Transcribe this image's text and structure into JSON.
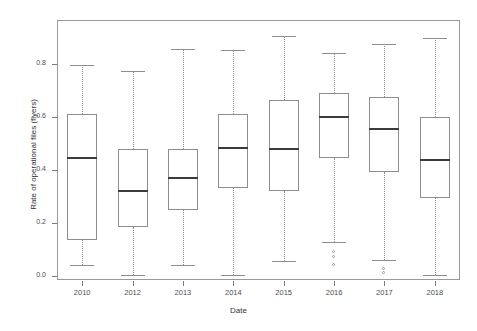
{
  "chart_data": {
    "type": "box",
    "title": "",
    "xlabel": "Date",
    "ylabel": "Rate of operational files (flyers)",
    "ylim": [
      0.0,
      0.9
    ],
    "yticks": [
      0.0,
      0.2,
      0.4,
      0.6,
      0.8
    ],
    "ytick_labels": [
      "0.0",
      "0.2",
      "0.4",
      "0.6",
      "0.8"
    ],
    "grid": false,
    "legend": "none",
    "categories": [
      "2010",
      "2012",
      "2013",
      "2014",
      "2015",
      "2016",
      "2017",
      "2018"
    ],
    "boxes": [
      {
        "category": "2010",
        "whisker_low": 0.042,
        "q1": 0.137,
        "median": 0.445,
        "q3": 0.612,
        "whisker_high": 0.795,
        "outliers": []
      },
      {
        "category": "2012",
        "whisker_low": 0.002,
        "q1": 0.185,
        "median": 0.32,
        "q3": 0.48,
        "whisker_high": 0.775,
        "outliers": []
      },
      {
        "category": "2013",
        "whisker_low": 0.04,
        "q1": 0.248,
        "median": 0.368,
        "q3": 0.48,
        "whisker_high": 0.858,
        "outliers": []
      },
      {
        "category": "2014",
        "whisker_low": 0.002,
        "q1": 0.332,
        "median": 0.483,
        "q3": 0.612,
        "whisker_high": 0.852,
        "outliers": []
      },
      {
        "category": "2015",
        "whisker_low": 0.055,
        "q1": 0.322,
        "median": 0.48,
        "q3": 0.665,
        "whisker_high": 0.905,
        "outliers": []
      },
      {
        "category": "2016",
        "whisker_low": 0.13,
        "q1": 0.445,
        "median": 0.6,
        "q3": 0.69,
        "whisker_high": 0.84,
        "outliers": [
          0.09,
          0.07,
          0.042
        ]
      },
      {
        "category": "2017",
        "whisker_low": 0.06,
        "q1": 0.392,
        "median": 0.555,
        "q3": 0.675,
        "whisker_high": 0.875,
        "outliers": [
          0.028,
          0.012
        ]
      },
      {
        "category": "2018",
        "whisker_low": 0.005,
        "q1": 0.295,
        "median": 0.437,
        "q3": 0.6,
        "whisker_high": 0.9,
        "outliers": []
      }
    ]
  },
  "axes": {
    "y_title": "Rate of operational files (flyers)",
    "x_title": "Date",
    "y_tick_labels": [
      "0.8",
      "0.6",
      "0.4",
      "0.2",
      "0.0"
    ],
    "x_tick_labels": [
      "2010",
      "2012",
      "2013",
      "2014",
      "2015",
      "2016",
      "2017",
      "2018"
    ]
  },
  "colors": {
    "frame": "#9a9a9a",
    "box_outline": "#8d8d8d",
    "median": "#3b3b3b",
    "whisker": "#8d8d8d",
    "outlier": "#9d9d9d",
    "text": "#4d4d4d",
    "background": "#ffffff"
  }
}
